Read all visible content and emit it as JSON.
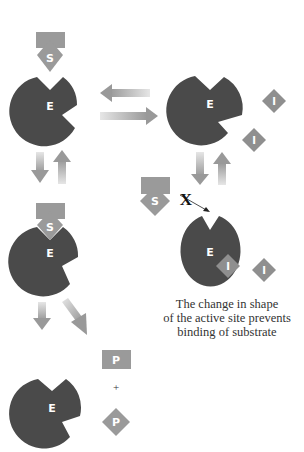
{
  "labels": {
    "enzyme": "E",
    "substrate": "S",
    "inhibitor": "I",
    "product": "P",
    "plus": "+",
    "blocked": "X"
  },
  "caption": {
    "line1": "The change in shape",
    "line2": "of the active site prevents",
    "line3": "binding of substrate"
  },
  "colors": {
    "enzyme": "#4a4a4a",
    "substrate": "#9a9a9a",
    "inhibitor": "#8f8f8f",
    "arrow": "#a0a0a0",
    "label": "#ffffff",
    "text": "#333333"
  }
}
